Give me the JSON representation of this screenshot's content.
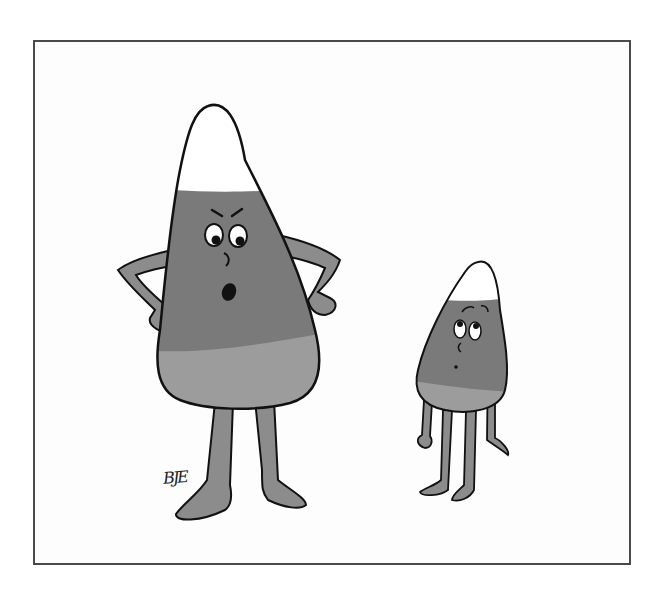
{
  "illustration": {
    "type": "single-panel cartoon",
    "subject": "large angry candy corn with hands on hips scolding a small worried candy corn",
    "signature": "BJE",
    "colors": {
      "frame": "#4a4a4a",
      "tip": "#ffffff",
      "middle_band": "#7a7a7a",
      "bottom_band": "#9c9c9c",
      "limbs": "#8c8c8c",
      "outline": "#111111"
    },
    "characters": [
      {
        "name": "big-candy-corn",
        "expression": "angry, mouth open",
        "pose": "hands on hips"
      },
      {
        "name": "small-candy-corn",
        "expression": "worried, eyes glancing up",
        "pose": "arms hanging down"
      }
    ]
  }
}
